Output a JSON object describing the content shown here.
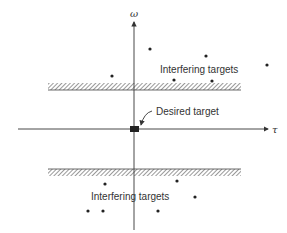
{
  "diagram": {
    "axes": {
      "vertical_label": "ω",
      "horizontal_label": "τ"
    },
    "labels": {
      "desired_target": "Desired target",
      "interfering_upper": "Interfering targets",
      "interfering_lower": "Interfering targets"
    },
    "colors": {
      "ink": "#333333",
      "background": "#ffffff"
    },
    "upper_points": [
      [
        112,
        76
      ],
      [
        150,
        49
      ],
      [
        206,
        56
      ],
      [
        174,
        80
      ],
      [
        212,
        81
      ],
      [
        267,
        65
      ]
    ],
    "lower_points": [
      [
        105,
        184
      ],
      [
        177,
        181
      ],
      [
        195,
        197
      ],
      [
        88,
        211
      ],
      [
        103,
        211
      ],
      [
        158,
        211
      ]
    ]
  }
}
